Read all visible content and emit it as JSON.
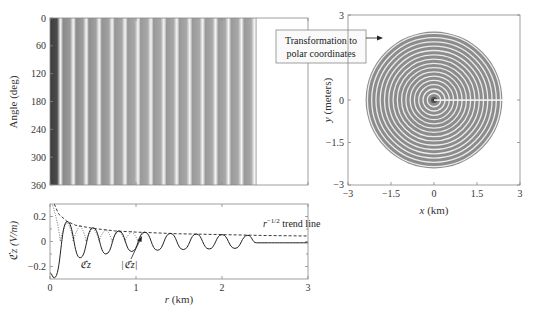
{
  "chart_data": [
    {
      "id": "heatmap",
      "type": "heatmap",
      "title": "",
      "xlabel": "",
      "ylabel": "Angle (deg)",
      "xlim": [
        0,
        3
      ],
      "ylim": [
        0,
        360
      ],
      "y_ticks": [
        "0",
        "60",
        "120",
        "180",
        "240",
        "300",
        "360"
      ],
      "y_tick_values": [
        0,
        60,
        120,
        180,
        240,
        300,
        360
      ],
      "x_ticks": [
        0,
        1,
        2,
        3
      ],
      "description": "Field intensity vs radius (columns) and angle (rows); banded vertical stripes, dark near r=0, stripes end at about r=2.4 km",
      "stripe_period_km": 0.15,
      "extent_km": 2.4,
      "colormap": "grayscale"
    },
    {
      "id": "polar",
      "type": "heatmap",
      "title": "",
      "xlabel": "x (km)",
      "ylabel": "y (meters)",
      "xlim": [
        -3,
        3
      ],
      "ylim": [
        -3,
        3
      ],
      "x_ticks": [
        "−3",
        "−1.5",
        "0",
        "1.5",
        "3"
      ],
      "x_tick_values": [
        -3,
        -1.5,
        0,
        1.5,
        3
      ],
      "y_ticks": [
        "3",
        "0",
        "−1.5",
        "−3"
      ],
      "y_tick_values": [
        3,
        0,
        -1.5,
        -3
      ],
      "description": "Concentric ring pattern (polar transform of heatmap), disk radius about 2.4 km, with a white seam along positive x axis",
      "disk_radius_km": 2.4,
      "ring_count": 16
    },
    {
      "id": "profile",
      "type": "line",
      "title": "",
      "xlabel": "r (km)",
      "ylabel": "ℭz (V/m)",
      "xlim": [
        0,
        3
      ],
      "ylim": [
        -0.3,
        0.3
      ],
      "x_ticks": [
        "0",
        "1",
        "2",
        "3"
      ],
      "x_tick_values": [
        0,
        1,
        2,
        3
      ],
      "y_ticks": [
        "0.2",
        "0",
        "−0.2"
      ],
      "y_tick_values": [
        0.2,
        0,
        -0.2
      ],
      "series": [
        {
          "name": "ℭz",
          "style": "solid",
          "x": [
            0.0,
            0.05,
            0.2,
            0.35,
            0.5,
            0.65,
            0.8,
            0.95,
            1.1,
            1.25,
            1.4,
            1.55,
            1.7,
            1.85,
            2.0,
            2.15,
            2.3,
            2.4,
            3.0
          ],
          "y": [
            -0.25,
            -0.29,
            0.16,
            -0.13,
            0.11,
            -0.1,
            0.085,
            -0.08,
            0.075,
            -0.07,
            0.065,
            -0.065,
            0.06,
            -0.06,
            0.055,
            -0.055,
            0.05,
            -0.01,
            -0.01
          ]
        },
        {
          "name": "|ℭz|",
          "style": "dotted",
          "x": [
            0.03,
            0.12,
            0.2,
            0.27,
            0.35,
            0.42,
            0.5,
            0.57,
            0.65,
            0.72,
            0.8,
            0.87,
            0.95,
            1.02,
            1.1
          ],
          "y": [
            0.29,
            0.0,
            0.16,
            0.0,
            0.13,
            0.0,
            0.11,
            0.0,
            0.1,
            0.0,
            0.085,
            0.0,
            0.08,
            0.0,
            0.075
          ]
        },
        {
          "name": "r^-1/2 trend line",
          "style": "dashed",
          "x": [
            0.05,
            0.1,
            0.2,
            0.3,
            0.5,
            0.75,
            1.0,
            1.5,
            2.0,
            2.5,
            3.0
          ],
          "y": [
            0.3,
            0.22,
            0.16,
            0.13,
            0.105,
            0.085,
            0.075,
            0.062,
            0.055,
            0.048,
            0.044
          ]
        }
      ],
      "annotations": [
        "r^-1/2 trend line",
        "ℭz",
        "|ℭz|"
      ]
    }
  ],
  "labels": {
    "heatmap_ylabel": "Angle (deg)",
    "heatmap_yticks": [
      "0",
      "60",
      "120",
      "180",
      "240",
      "300",
      "360"
    ],
    "profile_ylabel": "ℭz (V/m)",
    "profile_xlabel_r": "r",
    "profile_xlabel_unit": " (km)",
    "profile_yticks": [
      "0.2",
      "0",
      "−0.2"
    ],
    "profile_xticks": [
      "0",
      "1",
      "2",
      "3"
    ],
    "trend_label_r": "r",
    "trend_label_exp": "−1/2",
    "trend_label_rest": " trend line",
    "series_label_ez": "ℭz",
    "series_label_abs": "|ℭz|",
    "polar_xlabel_x": "x",
    "polar_xlabel_unit": " (km)",
    "polar_ylabel_y": "y",
    "polar_ylabel_unit": " (meters)",
    "polar_xticks": [
      "−3",
      "−1.5",
      "0",
      "1.5",
      "3"
    ],
    "polar_yticks": [
      "3",
      "0",
      "−1.5",
      "−3"
    ],
    "callout_line1": "Transformation to",
    "callout_line2": "polar coordinates"
  },
  "colors": {
    "axis": "#888888",
    "stripe_dark": "#8a8a8a",
    "stripe_light": "#f2f2f2",
    "center_dark": "#3a3a3a",
    "line": "#222222"
  }
}
